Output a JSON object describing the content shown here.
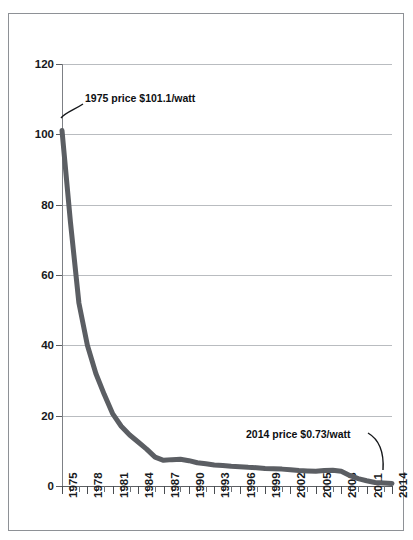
{
  "chart_data": {
    "type": "line",
    "title": "",
    "xlabel": "",
    "ylabel": "",
    "ylim": [
      0,
      120
    ],
    "xlim": [
      1975,
      2014
    ],
    "grid": true,
    "legend": false,
    "series_name": "Solar PV module price ($/watt)",
    "line_color": "#5b5e63",
    "x": [
      1975,
      1976,
      1977,
      1978,
      1979,
      1980,
      1981,
      1982,
      1983,
      1984,
      1985,
      1986,
      1987,
      1988,
      1989,
      1990,
      1991,
      1992,
      1993,
      1994,
      1995,
      1996,
      1997,
      1998,
      1999,
      2000,
      2001,
      2002,
      2003,
      2004,
      2005,
      2006,
      2007,
      2008,
      2009,
      2010,
      2011,
      2012,
      2013,
      2014
    ],
    "values": [
      101.1,
      75.0,
      52.0,
      40.0,
      32.0,
      26.0,
      20.5,
      17.0,
      14.5,
      12.5,
      10.5,
      8.2,
      7.3,
      7.5,
      7.6,
      7.2,
      6.6,
      6.3,
      6.0,
      5.8,
      5.6,
      5.5,
      5.3,
      5.2,
      5.0,
      4.9,
      4.8,
      4.6,
      4.4,
      4.3,
      4.2,
      4.4,
      4.5,
      4.2,
      3.0,
      2.1,
      1.5,
      1.0,
      0.85,
      0.73
    ],
    "y_ticks": [
      0,
      20,
      40,
      60,
      80,
      100,
      120
    ],
    "x_tick_labels": [
      "1975",
      "1978",
      "1981",
      "1984",
      "1987",
      "1990",
      "1993",
      "1996",
      "1999",
      "2002",
      "2005",
      "2008",
      "2011",
      "2014"
    ],
    "x_tick_label_years": [
      1975,
      1978,
      1981,
      1984,
      1987,
      1990,
      1993,
      1996,
      1999,
      2002,
      2005,
      2008,
      2011,
      2014
    ],
    "x_minor_tick_years": [
      1975,
      1976,
      1977,
      1978,
      1979,
      1980,
      1981,
      1982,
      1983,
      1984,
      1985,
      1986,
      1987,
      1988,
      1989,
      1990,
      1991,
      1992,
      1993,
      1994,
      1995,
      1996,
      1997,
      1998,
      1999,
      2000,
      2001,
      2002,
      2003,
      2004,
      2005,
      2006,
      2007,
      2008,
      2009,
      2010,
      2011,
      2012,
      2013,
      2014
    ],
    "annotations": [
      {
        "id": "start",
        "text": "1975 price $101.1/watt",
        "x": 1975,
        "y": 101.1
      },
      {
        "id": "end",
        "text": "2014 price $0.73/watt",
        "x": 2014,
        "y": 0.73
      }
    ]
  },
  "title_sliver": "",
  "colors": {
    "line": "#5b5e63",
    "grid": "#b9bcc0",
    "axis": "#5c5f63",
    "frame": "#8e9196",
    "text": "#17191c"
  }
}
